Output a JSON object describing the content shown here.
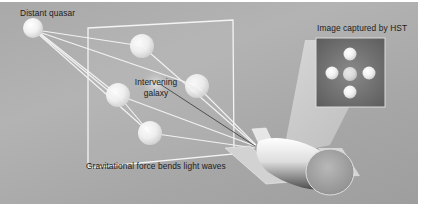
{
  "diagram": {
    "type": "gravitational-lensing-illustration",
    "labels": {
      "source": "Distant quasar",
      "lens_line1": "Intervening",
      "lens_line2": "galaxy",
      "lens_plane": "Gravitational force bends light waves",
      "observer_image": "Image captured by HST"
    },
    "nodes": [
      {
        "id": "quasar",
        "x": 33,
        "y": 26,
        "r": 10
      },
      {
        "id": "image-top",
        "x": 142,
        "y": 44,
        "r": 12
      },
      {
        "id": "image-left",
        "x": 118,
        "y": 93,
        "r": 12
      },
      {
        "id": "image-right",
        "x": 197,
        "y": 84,
        "r": 12
      },
      {
        "id": "image-bottom",
        "x": 150,
        "y": 131,
        "r": 12
      },
      {
        "id": "galaxy-center",
        "x": 156,
        "y": 80,
        "r": 12
      }
    ],
    "inset_dots": [
      "top",
      "left",
      "center",
      "right",
      "bottom"
    ],
    "colors": {
      "background": "#aaaaaa",
      "light_ray": "#f2f2f2",
      "inset_bg": "#6e6e6e",
      "text": "#1c1c1c"
    }
  }
}
